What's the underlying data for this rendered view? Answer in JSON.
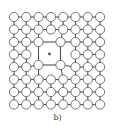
{
  "figure": {
    "caption": "b)",
    "lattice": {
      "rows": 8,
      "cols": 8,
      "origin_x": 14,
      "origin_y": 17,
      "spacing_x": 12.3,
      "spacing_y": 12.5,
      "atom_radius": 4.6,
      "atom_fill": "#ffffff",
      "stroke_color": "#555555",
      "defect": {
        "type": "interstitial-dot-with-distorted-cell",
        "center_x": 49.5,
        "center_y": 54,
        "dot_radius": 1.4,
        "dot_color": "#555555",
        "displaced_atoms": [
          {
            "row": 2,
            "col": 2,
            "x": 38.5,
            "y": 42
          },
          {
            "row": 2,
            "col": 4,
            "x": 60.5,
            "y": 42
          },
          {
            "row": 4,
            "col": 2,
            "x": 38.5,
            "y": 65
          },
          {
            "row": 4,
            "col": 4,
            "x": 60.5,
            "y": 65
          }
        ],
        "removed_atoms": [
          {
            "row": 2,
            "col": 3
          },
          {
            "row": 3,
            "col": 2
          },
          {
            "row": 3,
            "col": 3
          },
          {
            "row": 3,
            "col": 4
          },
          {
            "row": 4,
            "col": 3
          }
        ]
      }
    }
  }
}
